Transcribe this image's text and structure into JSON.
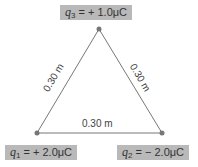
{
  "charges": [
    {
      "symbol": "q",
      "sub": "3",
      "value": "= + 1.0μC"
    },
    {
      "symbol": "q",
      "sub": "1",
      "value": "= + 2.0μC"
    },
    {
      "symbol": "q",
      "sub": "2",
      "value": "= − 2.0μC"
    }
  ],
  "distances": {
    "left": "0.30 m",
    "right": "0.30 m",
    "bottom": "0.30 m"
  },
  "colors": {
    "line": "#777777",
    "label_bg": "#b9b9b9",
    "dot": "#777777"
  }
}
